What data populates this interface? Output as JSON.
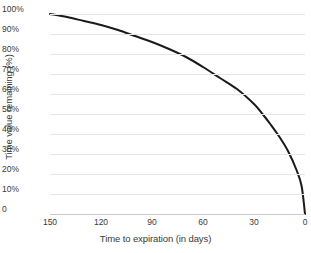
{
  "chart_data": {
    "type": "line",
    "title": "",
    "xlabel": "Time to expiration (in days)",
    "ylabel": "Time value remaining (%)",
    "x_tick_labels": [
      "150",
      "120",
      "90",
      "60",
      "30",
      "0"
    ],
    "x_tick_values": [
      150,
      120,
      90,
      60,
      30,
      0
    ],
    "y_tick_labels": [
      "100%",
      "90%",
      "80%",
      "70%",
      "60%",
      "50%",
      "40%",
      "30%",
      "20%",
      "10%",
      "0"
    ],
    "y_tick_values": [
      100,
      90,
      80,
      70,
      60,
      50,
      40,
      30,
      20,
      10,
      0
    ],
    "xlim": [
      150,
      0
    ],
    "ylim": [
      0,
      100
    ],
    "x_axis_reversed": true,
    "grid": "horizontal",
    "legend": "none",
    "series": [
      {
        "name": "Time value remaining",
        "color": "#1a1a1a",
        "line_width": 2,
        "x": [
          150,
          140,
          130,
          120,
          110,
          100,
          90,
          80,
          70,
          60,
          50,
          40,
          30,
          25,
          20,
          15,
          10,
          5,
          2,
          0
        ],
        "values": [
          100,
          98.5,
          96.5,
          94.5,
          92,
          89,
          86,
          82.5,
          78.5,
          73.5,
          68,
          62.5,
          55,
          50,
          44.5,
          38.5,
          31.5,
          22,
          14,
          0
        ]
      }
    ]
  },
  "colors": {
    "background": "#ffffff",
    "gridline": "#e6e6e6",
    "axis": "#c9c9c9",
    "curve": "#1a1a1a",
    "text": "#3a3a3a"
  }
}
